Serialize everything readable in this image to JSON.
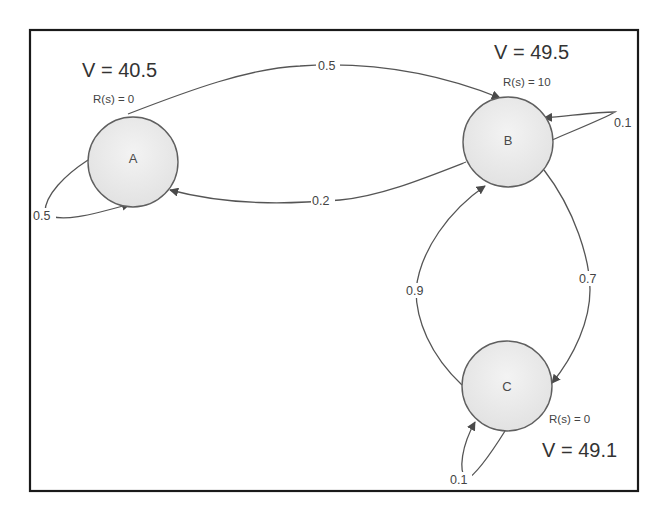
{
  "diagram": {
    "type": "markov-reward-process",
    "nodes": [
      {
        "id": "A",
        "label": "A",
        "value_label": "V = 40.5",
        "reward_label": "R(s) = 0"
      },
      {
        "id": "B",
        "label": "B",
        "value_label": "V = 49.5",
        "reward_label": "R(s) = 10"
      },
      {
        "id": "C",
        "label": "C",
        "value_label": "V = 49.1",
        "reward_label": "R(s) = 0"
      }
    ],
    "edges": [
      {
        "from": "A",
        "to": "B",
        "label": "0.5"
      },
      {
        "from": "B",
        "to": "A",
        "label": "0.2"
      },
      {
        "from": "A",
        "to": "A",
        "label": "0.5"
      },
      {
        "from": "B",
        "to": "B",
        "label": "0.1"
      },
      {
        "from": "B",
        "to": "C",
        "label": "0.7"
      },
      {
        "from": "C",
        "to": "B",
        "label": "0.9"
      },
      {
        "from": "C",
        "to": "C",
        "label": "0.1"
      }
    ],
    "colors": {
      "node_fill": "#ececec",
      "node_stroke": "#5f5f5f",
      "edge": "#555555",
      "frame": "#1a1a1a",
      "background": "#ffffff"
    }
  }
}
